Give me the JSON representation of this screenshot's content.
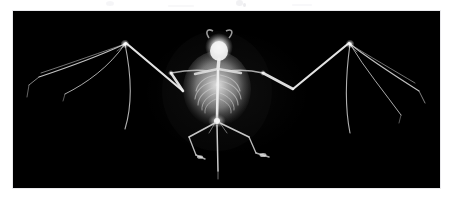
{
  "page": {
    "background_color": "#ffffff",
    "width": 452,
    "height": 199
  },
  "photo": {
    "name": "bat-skeleton-xray",
    "alt_text": "X-ray radiograph of a bat skeleton with wings fully outspread",
    "background_color": "#000000",
    "bone_color": "#f2f2f2",
    "frame": {
      "x": 13,
      "y": 11,
      "width": 427,
      "height": 177
    },
    "subject": "bat",
    "view": "ventral",
    "modality": "x-ray radiograph",
    "anatomy_labels": [
      "skull",
      "cervical vertebrae",
      "scapula",
      "sternum",
      "ribcage",
      "thoracic vertebrae",
      "lumbar vertebrae",
      "pelvis",
      "humerus",
      "radius",
      "carpal wrist joint",
      "metacarpals",
      "phalanges of digits II to V",
      "thumb claw",
      "femur",
      "tibia",
      "hind foot",
      "calcar",
      "tail vertebrae"
    ]
  },
  "artifacts": {
    "speckles_label": "scanner dust speckles",
    "count": 5
  }
}
